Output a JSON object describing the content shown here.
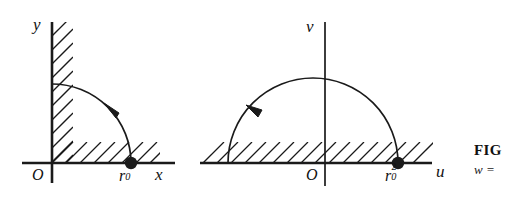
{
  "figure": {
    "type": "conformal-mapping-diagram",
    "background_color": "#ffffff",
    "stroke_color": "#1a1a1a",
    "panels": [
      {
        "name": "z-plane",
        "horizontal_axis_label": "x",
        "vertical_axis_label": "y",
        "origin_label": "O",
        "marked_point_label_base": "r",
        "marked_point_label_sub": "0",
        "curve": "quarter-circle-arc",
        "curve_direction": "counterclockwise",
        "hatching": "region-boundary-hatch",
        "arrow_direction": "counterclockwise"
      },
      {
        "name": "w-plane",
        "horizontal_axis_label": "u",
        "vertical_axis_label": "v",
        "origin_label": "O",
        "marked_point_label_base": "r",
        "marked_point_label_sub": "0",
        "marked_point_label_sup": "2",
        "curve": "semicircle-arc",
        "curve_direction": "counterclockwise",
        "hatching": "region-boundary-hatch",
        "arrow_direction": "counterclockwise"
      }
    ]
  },
  "caption": {
    "title": "FIG",
    "formula": "w ="
  }
}
